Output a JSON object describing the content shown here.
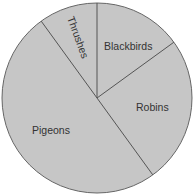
{
  "chart_data": {
    "type": "pie",
    "title": "",
    "categories": [
      "Blackbirds",
      "Robins",
      "Pigeons",
      "Thrushes"
    ],
    "values": [
      15,
      25,
      50,
      10
    ],
    "units": "percent (estimated from slice angles; no values printed)",
    "start_angle_deg": 0,
    "direction": "clockwise",
    "legend": "none (labels inside slices)",
    "colors": {
      "fill": "#c6c6c6",
      "line": "#555555",
      "text": "#333333"
    }
  },
  "labels": {
    "blackbirds": "Blackbirds",
    "robins": "Robins",
    "pigeons": "Pigeons",
    "thrushes": "Thrushes"
  }
}
